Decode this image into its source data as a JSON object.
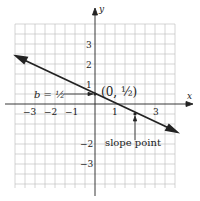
{
  "axes": {
    "x_label": "x",
    "y_label": "y"
  },
  "x_ticks": [
    {
      "label": "−3",
      "value": -3
    },
    {
      "label": "−2",
      "value": -2
    },
    {
      "label": "−1",
      "value": -1
    },
    {
      "label": "1",
      "value": 1
    },
    {
      "label": "3",
      "value": 3
    }
  ],
  "y_ticks": [
    {
      "label": "3",
      "value": 3
    },
    {
      "label": "2",
      "value": 2
    },
    {
      "label": "1",
      "value": 1
    },
    {
      "label": "−2",
      "value": -2
    },
    {
      "label": "−3",
      "value": -3
    }
  ],
  "annotations": {
    "intercept_label": "b = ½",
    "intercept_point": "(0, ½)",
    "slope_point_label": "slope point"
  },
  "line": {
    "slope": -0.5,
    "intercept": 0.5,
    "color": "#222222"
  }
}
